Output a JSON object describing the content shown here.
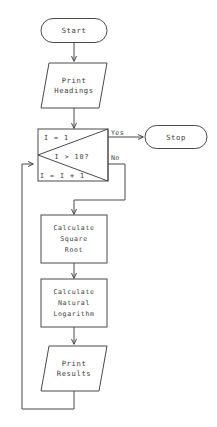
{
  "diagram": {
    "background_color": "#ffffff",
    "line_color": "#4a4a4a",
    "text_color": "#3d3d3d"
  },
  "nodes": {
    "start": {
      "label": "Start",
      "shape": "terminator-oval"
    },
    "print_headings": {
      "line1": "Print",
      "line2": "Headings",
      "shape": "parallelogram-io"
    },
    "decision": {
      "init_label": "I = 1",
      "condition_label": "I > 10?",
      "increment_label": "I = I + 1",
      "shape": "loop-decision"
    },
    "stop": {
      "label": "Stop",
      "shape": "terminator-oval"
    },
    "calc_sqrt": {
      "line1": "Calculate",
      "line2": "Square",
      "line3": "Root",
      "shape": "process-rectangle"
    },
    "calc_log": {
      "line1": "Calculate",
      "line2": "Natural",
      "line3": "Logarithm",
      "shape": "process-rectangle"
    },
    "print_results": {
      "line1": "Print",
      "line2": "Results",
      "shape": "parallelogram-io"
    }
  },
  "edge_labels": {
    "yes": "Yes",
    "no": "No"
  }
}
